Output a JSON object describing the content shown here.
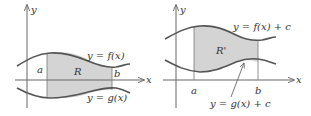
{
  "figure": {
    "left_panel": {
      "y_axis_label": "y",
      "x_axis_label": "x",
      "upper_curve_label": "y = f(x)",
      "lower_curve_label": "y = g(x)",
      "region_label": "R",
      "left_bound_label": "a",
      "right_bound_label": "b"
    },
    "right_panel": {
      "y_axis_label": "y",
      "x_axis_label": "x",
      "upper_curve_label": "y = f(x) + c",
      "lower_curve_label": "y = g(x) + c",
      "region_label": "R'",
      "left_bound_label": "a",
      "right_bound_label": "b"
    }
  },
  "colors": {
    "curve": "#555555",
    "axis": "#666666",
    "region_fill": "#d4d4d4",
    "text": "#333333"
  }
}
